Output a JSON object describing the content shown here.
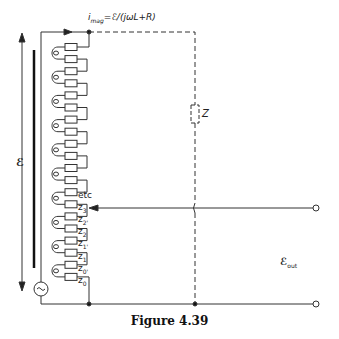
{
  "figure": {
    "caption": "Figure 4.39",
    "current_label": "i_mag = ℰ/(jωL + R)",
    "current_label_parts": {
      "i": "i",
      "sub": "mag",
      "rest": "=ℰ/(jωL+R)"
    },
    "emf_label": "ℰ",
    "impedance_label": "Z",
    "output_label": {
      "main": "ℰ",
      "sub": "out"
    },
    "tap_labels": [
      {
        "text": "etc",
        "sub": ""
      },
      {
        "text": "z",
        "sub": "3"
      },
      {
        "text": "z",
        "sub": "2'"
      },
      {
        "text": "z",
        "sub": "2"
      },
      {
        "text": "z",
        "sub": "1'"
      },
      {
        "text": "z",
        "sub": "1"
      },
      {
        "text": "z",
        "sub": "0'"
      },
      {
        "text": "z",
        "sub": "0"
      }
    ],
    "source_symbol": "~",
    "resistor_count": 20,
    "coil_count": 10
  }
}
